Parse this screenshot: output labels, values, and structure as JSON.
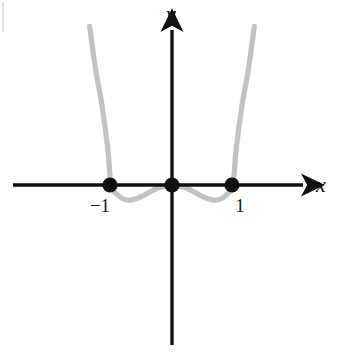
{
  "figure": {
    "title": "",
    "width": 345,
    "height": 353,
    "background_color": "#ffffff"
  },
  "axes": {
    "x_axis_label": "x",
    "y_axis_label": "y",
    "axis_color": "#111111",
    "origin_px": {
      "x": 172,
      "y": 185
    },
    "unit_px": 61
  },
  "ticks": {
    "x": [
      {
        "label": "−1",
        "value": -1
      },
      {
        "label": "1",
        "value": 1
      }
    ]
  },
  "chart_data": {
    "type": "line",
    "title": "",
    "xlabel": "x",
    "ylabel": "y",
    "grid": false,
    "legend": null,
    "curve_color": "#c3c3c3",
    "marker_color": "#111111",
    "function": "y = x^2(x^2 - 1)",
    "xlim": [
      -1.35,
      1.35
    ],
    "ylim": [
      -0.6,
      2.7
    ],
    "roots": [
      -1,
      0,
      1
    ],
    "minima": [
      {
        "x": -0.707,
        "y": -0.25
      },
      {
        "x": 0.707,
        "y": -0.25
      }
    ],
    "marked_points": [
      {
        "x": -1,
        "y": 0,
        "label": "−1"
      },
      {
        "x": 0,
        "y": 0,
        "label": ""
      },
      {
        "x": 1,
        "y": 0,
        "label": "1"
      }
    ],
    "x": [
      -1.35,
      -1.25,
      -1.15,
      -1.05,
      -1.0,
      -0.9,
      -0.8,
      -0.707,
      -0.6,
      -0.5,
      -0.4,
      -0.3,
      -0.2,
      -0.1,
      0.0,
      0.1,
      0.2,
      0.3,
      0.4,
      0.5,
      0.6,
      0.707,
      0.8,
      0.9,
      1.0,
      1.05,
      1.15,
      1.25,
      1.35
    ],
    "y": [
      2.6,
      1.88,
      1.32,
      0.57,
      0.0,
      -0.154,
      -0.23,
      -0.25,
      -0.23,
      -0.188,
      -0.134,
      -0.082,
      -0.038,
      -0.0099,
      0.0,
      -0.0099,
      -0.038,
      -0.082,
      -0.134,
      -0.188,
      -0.23,
      -0.25,
      -0.23,
      -0.154,
      0.0,
      0.57,
      1.32,
      1.88,
      2.6
    ]
  }
}
